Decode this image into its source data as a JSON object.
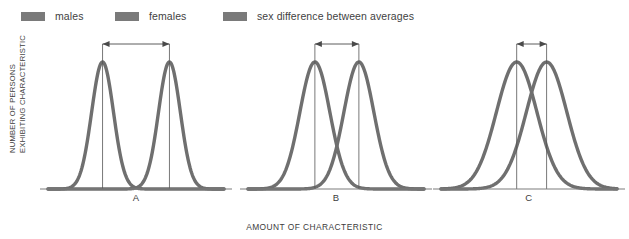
{
  "legend": {
    "items": [
      {
        "label": "males",
        "color": "#7a7a7a",
        "icon": "legend-swatch-icon"
      },
      {
        "label": "females",
        "color": "#7a7a7a",
        "icon": "legend-swatch-icon"
      },
      {
        "label": "sex difference between averages",
        "color": "#7a7a7a",
        "icon": "legend-swatch-icon"
      }
    ]
  },
  "axes": {
    "y_label_line1": "NUMBER OF PERSONS",
    "y_label_line2": "EXHIBITING CHARACTERISTIC",
    "x_label": "AMOUNT OF CHARACTERISTIC"
  },
  "panels": [
    {
      "label": "A"
    },
    {
      "label": "B"
    },
    {
      "label": "C"
    }
  ],
  "chart_data": {
    "type": "line",
    "title": "",
    "subtitle": "",
    "xlabel": "AMOUNT OF CHARACTERISTIC",
    "ylabel": "NUMBER OF PERSONS EXHIBITING CHARACTERISTIC",
    "grid": false,
    "legend_position": "top-left",
    "axis_ticks": false,
    "tick_labels": [],
    "curve_color": "#6f6f6f",
    "annotation_color": "#4a4a4a",
    "panels": [
      {
        "label": "A",
        "xlim": [
          0,
          10
        ],
        "ylim": [
          0,
          1
        ],
        "curves": [
          {
            "name": "males",
            "mean": 3.1,
            "sd": 0.62,
            "peak": 1.0
          },
          {
            "name": "females",
            "mean": 6.9,
            "sd": 0.62,
            "peak": 1.0
          }
        ],
        "mean_difference": 3.8,
        "overlap": "minimal",
        "annotation": {
          "type": "double-headed-arrow",
          "from_mean": 3.1,
          "to_mean": 6.9
        }
      },
      {
        "label": "B",
        "xlim": [
          0,
          10
        ],
        "ylim": [
          0,
          1
        ],
        "curves": [
          {
            "name": "males",
            "mean": 3.8,
            "sd": 0.85,
            "peak": 1.0
          },
          {
            "name": "females",
            "mean": 6.3,
            "sd": 0.85,
            "peak": 1.0
          }
        ],
        "mean_difference": 2.5,
        "overlap": "moderate",
        "annotation": {
          "type": "double-headed-arrow",
          "from_mean": 3.8,
          "to_mean": 6.3
        }
      },
      {
        "label": "C",
        "xlim": [
          0,
          10
        ],
        "ylim": [
          0,
          1
        ],
        "curves": [
          {
            "name": "males",
            "mean": 4.3,
            "sd": 1.15,
            "peak": 1.0
          },
          {
            "name": "females",
            "mean": 6.0,
            "sd": 1.15,
            "peak": 1.0
          }
        ],
        "mean_difference": 1.7,
        "overlap": "large",
        "annotation": {
          "type": "double-headed-arrow",
          "from_mean": 4.3,
          "to_mean": 6.0
        }
      }
    ]
  }
}
